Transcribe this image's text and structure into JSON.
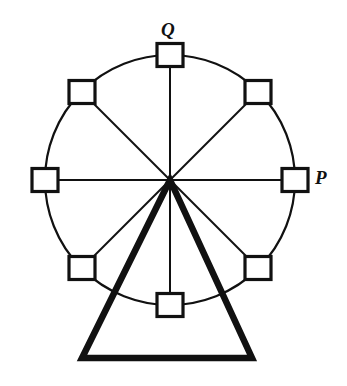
{
  "figure": {
    "background_color": "#ffffff",
    "stroke_color": "#111111",
    "fill_color": "#ffffff",
    "width": 347,
    "height": 386
  },
  "wheel": {
    "hub": {
      "cx": 170,
      "cy": 180
    },
    "rim": {
      "shape": "circle",
      "cx": 170,
      "cy": 180,
      "r": 125,
      "stroke_width": 2.2,
      "fill": "none"
    },
    "spoke_count": 8,
    "spoke_stroke_width": 2.0,
    "car_size": {
      "width": 26,
      "height": 23
    },
    "car_stroke_width": 3.2,
    "cars": [
      {
        "name": "car-top",
        "label": "Q",
        "angle_deg": 90,
        "cx": 170,
        "cy": 55
      },
      {
        "name": "car-upper-right",
        "label": "",
        "angle_deg": 45,
        "cx": 258,
        "cy": 92
      },
      {
        "name": "car-right",
        "label": "P",
        "angle_deg": 0,
        "cx": 295,
        "cy": 180
      },
      {
        "name": "car-lower-right",
        "label": "",
        "angle_deg": -45,
        "cx": 258,
        "cy": 268
      },
      {
        "name": "car-bottom",
        "label": "",
        "angle_deg": -90,
        "cx": 170,
        "cy": 305
      },
      {
        "name": "car-lower-left",
        "label": "",
        "angle_deg": -135,
        "cx": 82,
        "cy": 268
      },
      {
        "name": "car-left",
        "label": "",
        "angle_deg": 180,
        "cx": 45,
        "cy": 180
      },
      {
        "name": "car-upper-left",
        "label": "",
        "angle_deg": 135,
        "cx": 82,
        "cy": 92
      }
    ]
  },
  "support": {
    "shape": "triangle",
    "apex": {
      "x": 170,
      "y": 180
    },
    "base_left": {
      "x": 82,
      "y": 358
    },
    "base_right": {
      "x": 252,
      "y": 358
    },
    "stroke_width": 6.5,
    "fill": "none"
  },
  "labels": {
    "Q": "Q",
    "P": "P"
  }
}
